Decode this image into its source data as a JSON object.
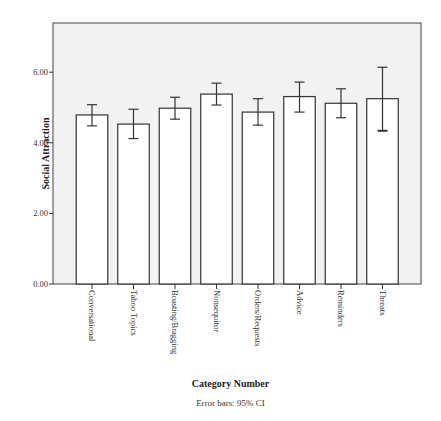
{
  "chart_data": {
    "type": "bar",
    "title": "",
    "xlabel": "Category Number",
    "ylabel": "Social Attraction",
    "footnote": "Error bars: 95% CI",
    "categories": [
      "Conversational",
      "Taboo Topics",
      "Boasting/Bragging",
      "Nonsequitur",
      "Orders/Requests",
      "Advice",
      "Reminders",
      "Threats"
    ],
    "values": [
      4.79,
      4.53,
      4.98,
      5.38,
      4.87,
      5.31,
      5.12,
      5.25
    ],
    "error_low": [
      4.48,
      4.12,
      4.67,
      5.07,
      4.5,
      4.87,
      4.71,
      4.34
    ],
    "error_high": [
      5.08,
      4.95,
      5.29,
      5.69,
      5.25,
      5.72,
      5.53,
      6.14
    ],
    "yticks": [
      "0.00",
      "2.00",
      "4.00",
      "6.00"
    ],
    "ytick_values": [
      0,
      2,
      4,
      6
    ],
    "ylim": [
      0,
      7.3
    ],
    "grid": false,
    "legend": "none",
    "colors": {
      "plot_bg": "#f2f2f2",
      "bar_fill": "#ffffff",
      "stroke": "#333333"
    }
  }
}
